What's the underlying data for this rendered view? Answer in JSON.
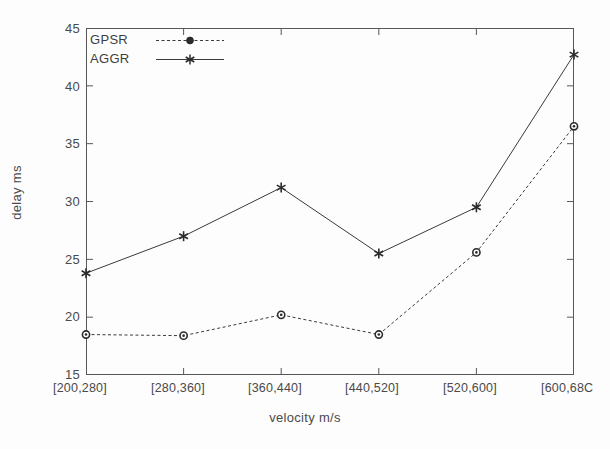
{
  "chart_data": {
    "type": "line",
    "title": "",
    "xlabel": "velocity m/s",
    "ylabel": "delay ms",
    "categories": [
      "[200,280]",
      "[280,360]",
      "[360,440]",
      "[440,520]",
      "[520,600]",
      "[600,680]"
    ],
    "xtick_labels": [
      "[200,280]",
      "[280,360]",
      "[360,440]",
      "[440,520]",
      "[520,600]",
      "[600,68C"
    ],
    "ytick_labels": [
      "45",
      "40",
      "35",
      "30",
      "25",
      "20",
      "15"
    ],
    "ytick_values": [
      45,
      40,
      35,
      30,
      25,
      20,
      15
    ],
    "ylim": [
      15,
      45
    ],
    "grid": false,
    "legend_position": "top-left",
    "series": [
      {
        "name": "GPSR",
        "marker": "circle",
        "linestyle": "dashed",
        "color": "#3a3a3a",
        "values": [
          18.5,
          18.4,
          20.2,
          18.5,
          25.6,
          36.5
        ]
      },
      {
        "name": "AGGR",
        "marker": "asterisk",
        "linestyle": "solid",
        "color": "#3a3a3a",
        "values": [
          23.8,
          27.0,
          31.2,
          25.5,
          29.5,
          42.7
        ]
      }
    ]
  },
  "legend": {
    "entries": [
      {
        "label": "GPSR"
      },
      {
        "label": "AGGR"
      }
    ]
  },
  "colors": {
    "axis": "#585858",
    "text": "#4a4a4a",
    "line": "#3a3a3a",
    "background": "#fdfdfd"
  }
}
